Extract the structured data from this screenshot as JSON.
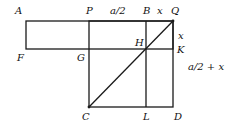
{
  "diagram": {
    "points": {
      "A": "A",
      "P": "P",
      "B": "B",
      "Q": "Q",
      "F": "F",
      "G": "G",
      "H": "H",
      "K": "K",
      "C": "C",
      "L": "L",
      "D": "D"
    },
    "measures": {
      "PB": "a/2",
      "BQ": "x",
      "QK": "x",
      "KD": "a/2 + x"
    },
    "colors": {
      "line": "#1a1a1a",
      "background": "#ffffff"
    }
  }
}
